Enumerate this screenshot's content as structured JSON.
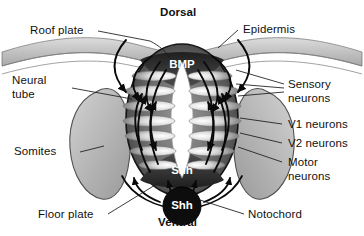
{
  "figure": {
    "type": "biological-diagram"
  },
  "orientation": {
    "dorsal": "Dorsal",
    "ventral": "Ventral"
  },
  "signals": {
    "bmp": "BMP",
    "shh_floor_plate": "Shh",
    "shh_notochord": "Shh"
  },
  "labels": {
    "roof_plate": "Roof plate",
    "epidermis": "Epidermis",
    "neural_tube_line1": "Neural",
    "neural_tube_line2": "tube",
    "somites": "Somites",
    "floor_plate": "Floor plate",
    "notochord": "Notochord",
    "sensory_line1": "Sensory",
    "sensory_line2": "neurons",
    "v1_neurons": "V1 neurons",
    "v2_neurons": "V2 neurons",
    "motor_line1": "Motor",
    "motor_line2": "neurons"
  },
  "colors": {
    "ink": "#111111",
    "tube_dark": "#3a3a3a",
    "tube_mid": "#5d5d5d",
    "tube_light": "#b9b9b9",
    "lumen": "#ffffff",
    "notochord": "#0d0d0d",
    "somite_fill": "#b5b5b5",
    "epidermis_fill": "#c2c2c2",
    "background": "#ffffff"
  }
}
